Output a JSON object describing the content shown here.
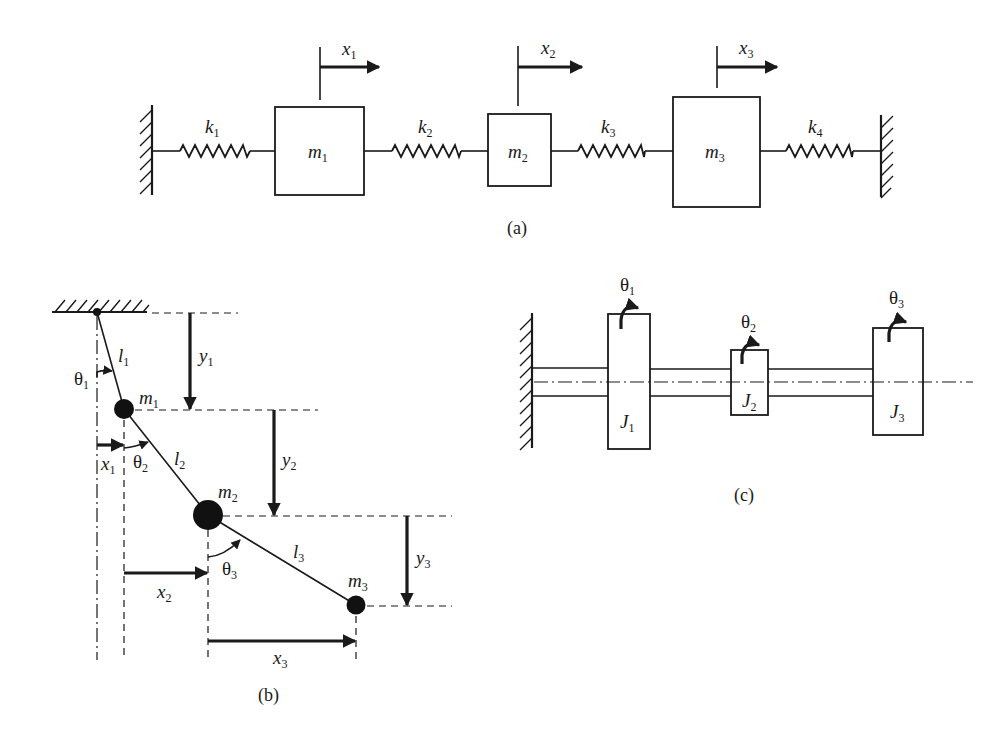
{
  "figure": {
    "panel_a": {
      "caption": "(a)",
      "walls": [
        {
          "x": 152,
          "y1": 105,
          "y2": 195,
          "side": "left"
        },
        {
          "x": 881,
          "y1": 115,
          "y2": 197,
          "side": "right"
        }
      ],
      "line_y": 151,
      "masses": [
        {
          "label": "m",
          "sub": "1",
          "x": 275,
          "y": 107,
          "w": 89,
          "h": 88
        },
        {
          "label": "m",
          "sub": "2",
          "x": 488,
          "y": 114,
          "w": 63,
          "h": 72
        },
        {
          "label": "m",
          "sub": "3",
          "x": 673,
          "y": 97,
          "w": 87,
          "h": 110
        }
      ],
      "springs": [
        {
          "label": "k",
          "sub": "1",
          "x1": 152,
          "x2": 275,
          "zx1": 180,
          "zx2": 250
        },
        {
          "label": "k",
          "sub": "2",
          "x1": 364,
          "x2": 488,
          "zx1": 392,
          "zx2": 461
        },
        {
          "label": "k",
          "sub": "3",
          "x1": 551,
          "x2": 673,
          "zx1": 578,
          "zx2": 645
        },
        {
          "label": "k",
          "sub": "4",
          "x1": 760,
          "x2": 881,
          "zx1": 786,
          "zx2": 853
        }
      ],
      "displacements": [
        {
          "label": "x",
          "sub": "1",
          "x": 320,
          "ytop": 58,
          "ybot": 100
        },
        {
          "label": "x",
          "sub": "2",
          "x": 518,
          "ytop": 57,
          "ybot": 106
        },
        {
          "label": "x",
          "sub": "3",
          "x": 717,
          "ytop": 57,
          "ybot": 88
        }
      ]
    },
    "panel_b": {
      "caption": "(b)",
      "pivot": {
        "x": 97,
        "y": 312
      },
      "masses": [
        {
          "label": "m",
          "sub": "1",
          "x": 124,
          "y": 409,
          "r": 10
        },
        {
          "label": "m",
          "sub": "2",
          "x": 208,
          "y": 515,
          "r": 15
        },
        {
          "label": "m",
          "sub": "3",
          "x": 356,
          "y": 605,
          "r": 10
        }
      ],
      "links": [
        {
          "label": "l",
          "sub": "1"
        },
        {
          "label": "l",
          "sub": "2"
        },
        {
          "label": "l",
          "sub": "3"
        }
      ],
      "angles": [
        {
          "label": "θ",
          "sub": "1"
        },
        {
          "label": "θ",
          "sub": "2"
        },
        {
          "label": "θ",
          "sub": "3"
        }
      ],
      "horizontal_displacements": [
        {
          "label": "x",
          "sub": "1"
        },
        {
          "label": "x",
          "sub": "2"
        },
        {
          "label": "x",
          "sub": "3"
        }
      ],
      "vertical_displacements": [
        {
          "label": "y",
          "sub": "1"
        },
        {
          "label": "y",
          "sub": "2"
        },
        {
          "label": "y",
          "sub": "3"
        }
      ]
    },
    "panel_c": {
      "caption": "(c)",
      "wall": {
        "x": 532,
        "y1": 313,
        "y2": 448
      },
      "shaft": {
        "y_top": 368,
        "y_bot": 396,
        "center_y": 382,
        "center_x_end": 973
      },
      "disks": [
        {
          "label": "J",
          "sub": "1",
          "angle_label": "θ",
          "angle_sub": "1",
          "x": 608,
          "y": 314,
          "w": 42,
          "h": 135
        },
        {
          "label": "J",
          "sub": "2",
          "angle_label": "θ",
          "angle_sub": "2",
          "x": 731,
          "y": 350,
          "w": 37,
          "h": 65
        },
        {
          "label": "J",
          "sub": "3",
          "angle_label": "θ",
          "angle_sub": "3",
          "x": 873,
          "y": 328,
          "w": 50,
          "h": 107
        }
      ]
    }
  }
}
